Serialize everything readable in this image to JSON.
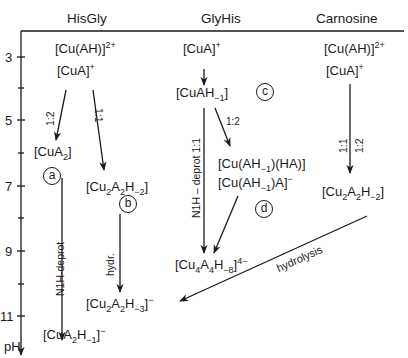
{
  "columns": [
    {
      "name": "HisGly"
    },
    {
      "name": "GlyHis"
    },
    {
      "name": "Carnosine"
    }
  ],
  "axis": {
    "label": "pH",
    "ticks": [
      "3",
      "5",
      "7",
      "9",
      "11"
    ],
    "minor_ticks": [
      "4",
      "6",
      "8",
      "10"
    ]
  },
  "hisgly": {
    "start_1": {
      "base": "[Cu(AH)]",
      "sup": "2+"
    },
    "start_2": {
      "base": "[CuA]",
      "sup": "+"
    },
    "ratio_left": "1:2",
    "ratio_right": "1:1",
    "cua2": {
      "pre": "[CuA",
      "sub": "2",
      "post": "]"
    },
    "label_a": "a",
    "cu2a2h2": {
      "p1": "[Cu",
      "s1": "2",
      "p2": "A",
      "s2": "2",
      "p3": "H",
      "s3": "−2",
      "p4": "]"
    },
    "label_b": "b",
    "n1h_deprot": "N1H-deprot",
    "hydr": "hydr.",
    "cu2a2h3": {
      "p1": "[Cu",
      "s1": "2",
      "p2": "A",
      "s2": "2",
      "p3": "H",
      "s3": "−3",
      "p4": "]",
      "sup": "−"
    },
    "cua2h1": {
      "p1": "[CuA",
      "s1": "2",
      "p2": "H",
      "s2": "−1",
      "p3": "]",
      "sup": "−"
    }
  },
  "glyhis": {
    "start": {
      "base": "[CuA]",
      "sup": "+"
    },
    "cuah1": {
      "p1": "[CuAH",
      "s1": "−1",
      "p2": "]"
    },
    "label_c": "c",
    "ratio": "1:2",
    "n1h_deprot": "N1H – deprot 1:1",
    "complex_1": {
      "p1": "[Cu(AH",
      "s1": "−1",
      "p2": ")(HA)]"
    },
    "complex_2": {
      "p1": "[Cu(AH",
      "s1": "−1",
      "p2": ")A]",
      "sup": "−"
    },
    "label_d": "d",
    "tetramer": {
      "p1": "[Cu",
      "s1": "4",
      "p2": "A",
      "s2": "4",
      "p3": "H",
      "s3": "−8",
      "p4": "]",
      "sup": "4−"
    }
  },
  "carnosine": {
    "start_1": {
      "base": "[Cu(AH)]",
      "sup": "2+"
    },
    "start_2": {
      "base": "[CuA]",
      "sup": "+"
    },
    "ratio_1": "1:1",
    "ratio_2": "1:2",
    "dimer": {
      "p1": "[Cu",
      "s1": "2",
      "p2": "A",
      "s2": "2",
      "p3": "H",
      "s3": "−2",
      "p4": "]"
    },
    "hydrolysis": "hydrolysis"
  }
}
